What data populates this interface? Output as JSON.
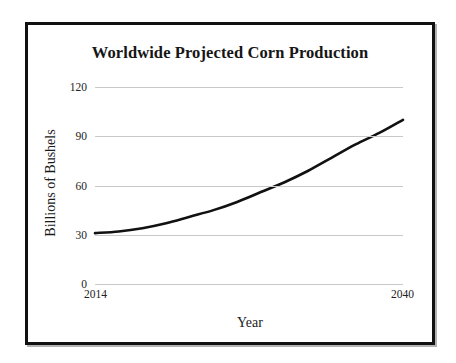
{
  "figure": {
    "title": "Worldwide Projected Corn Production"
  },
  "chart_data": {
    "type": "line",
    "title": "Worldwide Projected Corn Production",
    "xlabel": "Year",
    "ylabel": "Billions of Bushels",
    "xlim": [
      2014,
      2040
    ],
    "ylim": [
      0,
      120
    ],
    "grid": true,
    "legend": null,
    "x_tick_labels": [
      "2014",
      "2040"
    ],
    "y_tick_labels": [
      "0",
      "30",
      "60",
      "90",
      "120"
    ],
    "y_ticks": [
      0,
      30,
      60,
      90,
      120
    ],
    "x_ticks": [
      2014,
      2040
    ],
    "series": [
      {
        "name": "Projected corn production",
        "color": "#111111",
        "line_width": 2.6,
        "x": [
          2014,
          2016,
          2018,
          2020,
          2022,
          2024,
          2026,
          2028,
          2030,
          2032,
          2034,
          2036,
          2038,
          2040
        ],
        "values": [
          31,
          32,
          34,
          37,
          41,
          45,
          50,
          56,
          62,
          69,
          77,
          85,
          92,
          100
        ]
      }
    ]
  }
}
